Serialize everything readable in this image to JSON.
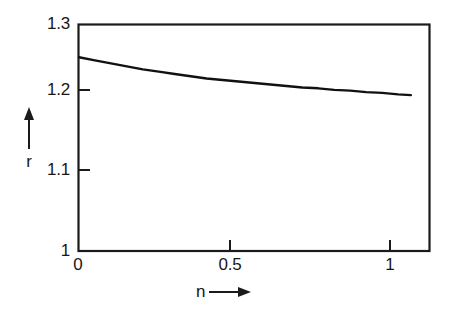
{
  "chart_data": {
    "type": "line",
    "title": "",
    "subtitle": "",
    "xlabel": "n",
    "ylabel": "r",
    "xlabel_arrow": "right-arrow",
    "ylabel_arrow": "up-arrow",
    "xlim": [
      0,
      1.1
    ],
    "ylim": [
      1,
      1.3
    ],
    "xticks": [
      0,
      0.5,
      1
    ],
    "xtick_labels": [
      "0",
      "0.5",
      "1"
    ],
    "yticks": [
      1,
      1.1,
      1.2,
      1.3
    ],
    "ytick_labels": [
      "1",
      "1.1",
      "1.2",
      "1.3"
    ],
    "grid": false,
    "legend": false,
    "legend_position": "none",
    "line_color": "#111111",
    "background_color": "#ffffff",
    "frame": "box",
    "series": [
      {
        "name": "r(n)",
        "x": [
          0.0,
          0.05,
          0.1,
          0.15,
          0.2,
          0.25,
          0.3,
          0.35,
          0.4,
          0.45,
          0.5,
          0.55,
          0.6,
          0.65,
          0.7,
          0.75,
          0.8,
          0.85,
          0.9,
          0.95,
          1.0,
          1.04
        ],
        "values": [
          1.256,
          1.252,
          1.248,
          1.244,
          1.24,
          1.237,
          1.234,
          1.231,
          1.228,
          1.226,
          1.224,
          1.222,
          1.22,
          1.218,
          1.216,
          1.215,
          1.213,
          1.212,
          1.21,
          1.209,
          1.207,
          1.206
        ]
      }
    ],
    "annotations": []
  },
  "axes": {
    "y_title": "r",
    "x_title": "n"
  }
}
